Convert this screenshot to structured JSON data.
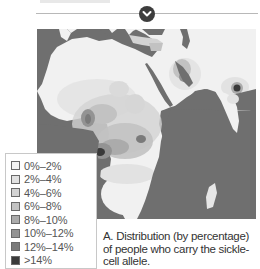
{
  "header": {
    "expand_icon": "chevron-down-icon"
  },
  "map": {
    "subject": "Sickle-cell allele carrier distribution map of Africa, Middle East and India",
    "ocean_color": "#6f6f6f",
    "land_base_color": "#f1f1f1"
  },
  "legend": {
    "items": [
      {
        "label": "0%–2%",
        "color": "#f4f4f4"
      },
      {
        "label": "2%–4%",
        "color": "#e2e2e2"
      },
      {
        "label": "4%–6%",
        "color": "#d3d3d3"
      },
      {
        "label": "6%–8%",
        "color": "#c2c2c2"
      },
      {
        "label": "8%–10%",
        "color": "#ababab"
      },
      {
        "label": "10%–12%",
        "color": "#939393"
      },
      {
        "label": "12%–14%",
        "color": "#7a7a7a"
      },
      {
        "label": ">14%",
        "color": "#3a3a3a"
      }
    ]
  },
  "caption": {
    "text": "A. Distribution (by percentage) of people who carry the sickle-cell allele."
  }
}
